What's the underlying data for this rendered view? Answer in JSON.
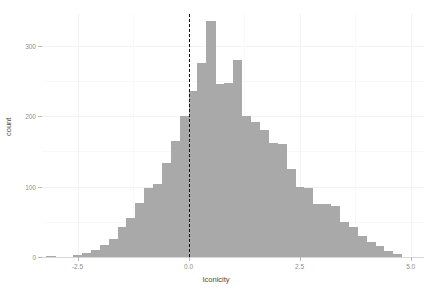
{
  "chart_data": {
    "type": "bar",
    "title": "",
    "subtitle": "",
    "xlabel": "Iconicity",
    "ylabel": "count",
    "xlim": [
      -3.3,
      5.3
    ],
    "ylim": [
      0,
      345
    ],
    "grid": true,
    "legend": null,
    "bin_width": 0.2,
    "bar_color": "#a9a9a9",
    "annotations": [
      {
        "name": "zero-reference-line",
        "type": "vline",
        "x": 0.0,
        "style": "dashed",
        "color": "#111111"
      }
    ],
    "xticks": [
      -2.5,
      0.0,
      2.5,
      5.0
    ],
    "xtick_labels": [
      "-2.5",
      "0.0",
      "2.5",
      "5.0"
    ],
    "yticks": [
      0,
      100,
      200,
      300
    ],
    "ytick_labels": [
      "0",
      "100",
      "200",
      "300"
    ],
    "x": [
      -3.1,
      -2.9,
      -2.7,
      -2.5,
      -2.3,
      -2.1,
      -1.9,
      -1.7,
      -1.5,
      -1.3,
      -1.1,
      -0.9,
      -0.7,
      -0.5,
      -0.3,
      -0.1,
      0.1,
      0.3,
      0.5,
      0.7,
      0.9,
      1.1,
      1.3,
      1.5,
      1.7,
      1.9,
      2.1,
      2.3,
      2.5,
      2.7,
      2.9,
      3.1,
      3.3,
      3.5,
      3.7,
      3.9,
      4.1,
      4.3,
      4.5,
      4.7
    ],
    "values": [
      2,
      0,
      0,
      3,
      5,
      10,
      17,
      26,
      42,
      55,
      76,
      98,
      103,
      134,
      165,
      200,
      235,
      275,
      335,
      245,
      247,
      280,
      200,
      192,
      180,
      162,
      160,
      125,
      100,
      98,
      75,
      75,
      72,
      50,
      42,
      30,
      22,
      15,
      9,
      4
    ]
  },
  "axes": {
    "x_title": "Iconicity",
    "y_title": "count"
  }
}
